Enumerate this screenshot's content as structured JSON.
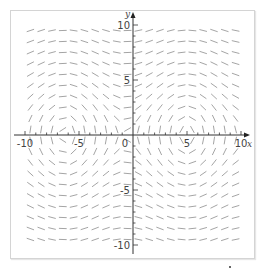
{
  "chart_data": {
    "type": "slope_field",
    "title": "",
    "xlabel": "x",
    "ylabel": "y",
    "xlim": [
      -10,
      10
    ],
    "ylim": [
      -10,
      10
    ],
    "x_ticks": [
      -10,
      -5,
      0,
      5,
      10
    ],
    "y_ticks": [
      -10,
      -5,
      5,
      10
    ],
    "x_tick_labels": [
      "-10",
      "-5",
      "0",
      "5",
      "10"
    ],
    "y_tick_labels": [
      "-10",
      "-5",
      "5",
      "10"
    ],
    "minor_tick_step": 1,
    "grid": false,
    "legend": null,
    "field_description": "Direction field of the form dy/dx = f(x)/y: segments vertical near the x-axis, flattening with |y|; wavy pattern with arches (y>0) near x≈-6.3 and x≈5, valleys near x≈-2.8 and x≈8.3; mirrored below the x-axis",
    "sample_grid": {
      "x_start": -9.5,
      "x_end": 9.5,
      "x_step": 1,
      "y_start": -9.5,
      "y_end": 9.5,
      "y_step": 1
    },
    "segment_length_px": 7,
    "colors": {
      "axis": "#333333",
      "segments": "#9a9a9a",
      "frame": "#d4d4d4"
    }
  }
}
